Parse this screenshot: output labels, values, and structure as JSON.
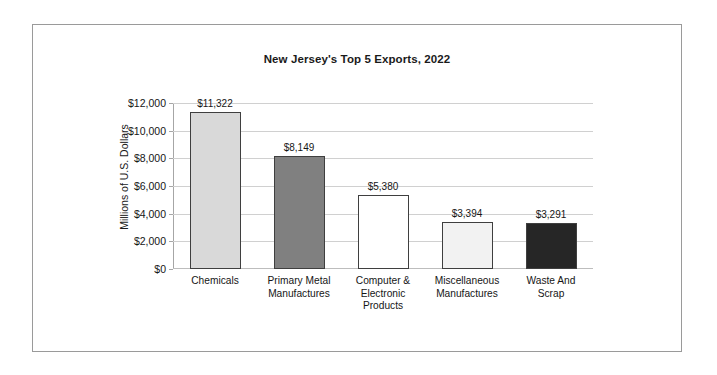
{
  "figure": {
    "title": "New Jersey's Top 5 Exports, 2022",
    "y_axis_title": "Millions of U.S. Dollars",
    "frame_color": "#9a9a9a",
    "background": "#ffffff",
    "gridline_color": "#d0d0d0",
    "bar_border_color": "#3f3f3f"
  },
  "chart_data": {
    "type": "bar",
    "title": "New Jersey's Top 5 Exports, 2022",
    "xlabel": "",
    "ylabel": "Millions of U.S. Dollars",
    "ylim": [
      0,
      12000
    ],
    "ytick_step": 2000,
    "grid": true,
    "legend": "none",
    "yticks": [
      "$0",
      "$2,000",
      "$4,000",
      "$6,000",
      "$8,000",
      "$10,000",
      "$12,000"
    ],
    "ytick_values": [
      0,
      2000,
      4000,
      6000,
      8000,
      10000,
      12000
    ],
    "categories": [
      "Chemicals",
      "Primary Metal Manufactures",
      "Computer & Electronic Products",
      "Miscellaneous Manufactures",
      "Waste And Scrap"
    ],
    "category_lines": [
      [
        "Chemicals"
      ],
      [
        "Primary Metal",
        "Manufactures"
      ],
      [
        "Computer &",
        "Electronic",
        "Products"
      ],
      [
        "Miscellaneous",
        "Manufactures"
      ],
      [
        "Waste And",
        "Scrap"
      ]
    ],
    "values": [
      11322,
      8149,
      5380,
      3394,
      3291
    ],
    "data_labels": [
      "$11,322",
      "$8,149",
      "$5,380",
      "$3,394",
      "$3,291"
    ],
    "bar_colors": [
      "#d9d9d9",
      "#808080",
      "#ffffff",
      "#f2f2f2",
      "#262626"
    ]
  }
}
